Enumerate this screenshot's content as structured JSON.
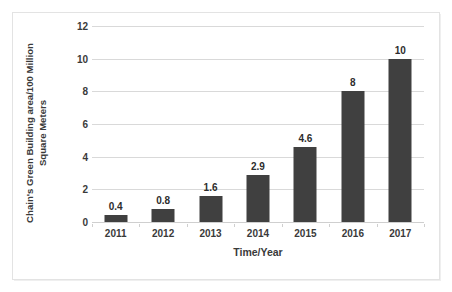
{
  "chart_data": {
    "type": "bar",
    "title": "",
    "categories": [
      "2011",
      "2012",
      "2013",
      "2014",
      "2015",
      "2016",
      "2017"
    ],
    "values": [
      0.4,
      0.8,
      1.6,
      2.9,
      4.6,
      8,
      10
    ],
    "value_labels": [
      "0.4",
      "0.8",
      "1.6",
      "2.9",
      "4.6",
      "8",
      "10"
    ],
    "xlabel": "Time/Year",
    "ylabel_line1": "Chain's Green Building area/100 Million",
    "ylabel_line2": "Square Meters",
    "ylabel": "Chain's Green Building area/100 Million Square Meters",
    "ylim": [
      0,
      12
    ],
    "yticks": [
      0,
      2,
      4,
      6,
      8,
      10,
      12
    ],
    "ytick_labels": [
      "0",
      "2",
      "4",
      "6",
      "8",
      "10",
      "12"
    ],
    "grid": "horizontal",
    "legend": "none",
    "series_color": "#404040",
    "gridline_color": "#d9d9d9",
    "background_color": "#ffffff"
  }
}
